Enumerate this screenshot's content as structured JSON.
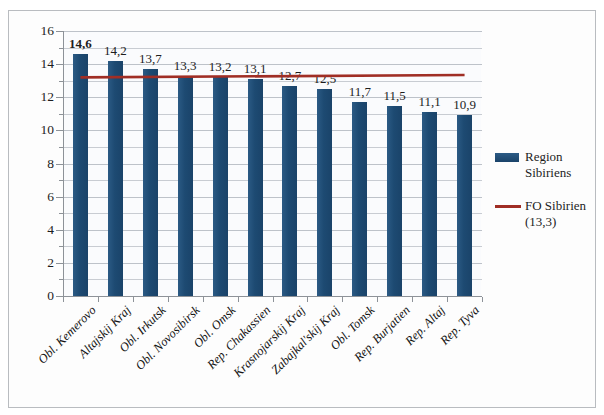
{
  "chart_data": {
    "type": "bar",
    "title": "",
    "subtitle": "",
    "xlabel": "",
    "ylabel": "",
    "ylim": [
      0,
      16
    ],
    "ytick_step": 2,
    "minor_gridline_step": 1,
    "grid": true,
    "legend_position": "right",
    "categories": [
      "Obl. Kemerovo",
      "Altajskij Kraj",
      "Obl. Irkutsk",
      "Obl. Novosibirsk",
      "Obl. Omsk",
      "Rep. Chakassien",
      "Krasnojarskij Kraj",
      "Zabajkal'skij Kraj",
      "Obl. Tomsk",
      "Rep. Burjatien",
      "Rep. Altaj",
      "Rep. Tyva"
    ],
    "values": [
      14.6,
      14.2,
      13.7,
      13.3,
      13.2,
      13.1,
      12.7,
      12.5,
      11.7,
      11.5,
      11.1,
      10.9
    ],
    "data_labels": [
      "14,6",
      "14,2",
      "13,7",
      "13,3",
      "13,2",
      "13,1",
      "12,7",
      "12,5",
      "11,7",
      "11,5",
      "11,1",
      "10,9"
    ],
    "bold_data_labels": [
      true,
      false,
      false,
      false,
      false,
      false,
      false,
      false,
      false,
      false,
      false,
      false
    ],
    "ytick_labels": [
      "16",
      "14",
      "12",
      "10",
      "8",
      "6",
      "4",
      "2",
      "0"
    ],
    "ytick_values": [
      16,
      14,
      12,
      10,
      8,
      6,
      4,
      2,
      0
    ],
    "series": [
      {
        "name": "Region Sibiriens",
        "kind": "bar",
        "color": "#1F4D76",
        "values": [
          14.6,
          14.2,
          13.7,
          13.3,
          13.2,
          13.1,
          12.7,
          12.5,
          11.7,
          11.5,
          11.1,
          10.9
        ]
      },
      {
        "name": "FO Sibirien (13,3)",
        "kind": "line",
        "color": "#A02E25",
        "reference_value": 13.3,
        "values": [
          13.3,
          13.3,
          13.3,
          13.3,
          13.3,
          13.3,
          13.3,
          13.3,
          13.3,
          13.3,
          13.3,
          13.3
        ]
      }
    ]
  },
  "legend": {
    "entries": [
      {
        "label_line1": "Region",
        "label_line2": "Sibiriens",
        "swatch": "bar-swatch",
        "color": "#1F4D76"
      },
      {
        "label_line1": "FO Sibirien",
        "label_line2": "(13,3)",
        "swatch": "line-swatch",
        "color": "#A02E25"
      }
    ]
  },
  "colors": {
    "bar": "#1F4D76",
    "reference_line": "#A02E25",
    "gridline": "#C8CCD2",
    "axis": "#8D9298",
    "frame_border": "#B9BCC0",
    "plot_background": "#FAFBFD",
    "page_background": "#FFFFFF",
    "text": "#1D1D1D"
  }
}
